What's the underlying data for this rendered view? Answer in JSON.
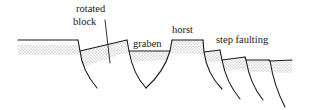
{
  "diagram": {
    "type": "geological cross-section",
    "labels": {
      "rotated_block": [
        "rotated",
        "block"
      ],
      "graben": "graben",
      "horst": "horst",
      "step_faulting": "step faulting"
    },
    "colors": {
      "line": "#1a1a1a",
      "stipple": "#8a8a8a",
      "background": "#ffffff"
    }
  }
}
